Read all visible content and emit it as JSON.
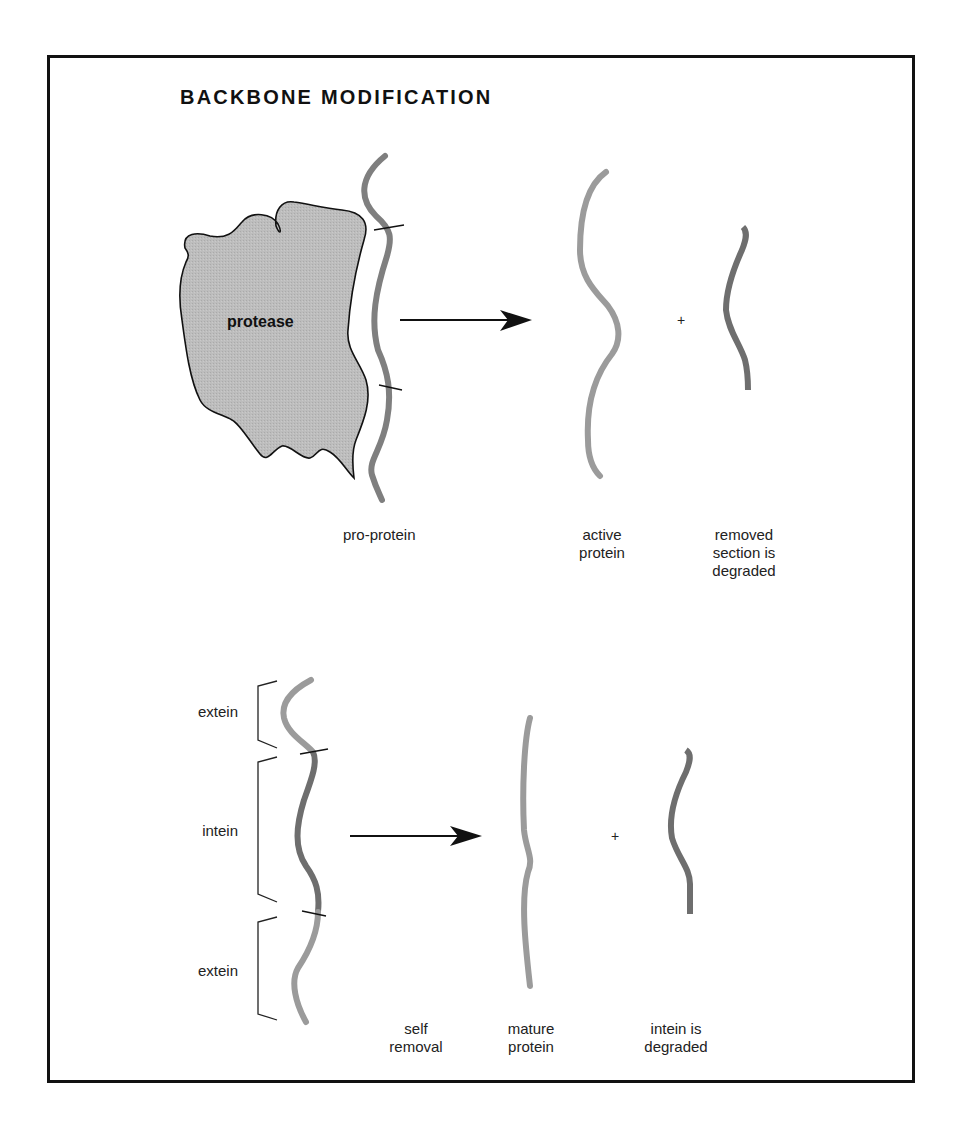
{
  "title": "BACKBONE MODIFICATION",
  "colors": {
    "frame": "#111111",
    "protease_fill": "#bdbdbd",
    "active_strand": "#9b9b9b",
    "removed_strand": "#6e6e6e",
    "arrow": "#111111"
  },
  "top_panel": {
    "enzyme_label": "protease",
    "plus": "+",
    "labels": {
      "pro_protein": "pro-protein",
      "active_protein_1": "active",
      "active_protein_2": "protein",
      "removed_1": "removed",
      "removed_2": "section is",
      "removed_3": "degraded"
    }
  },
  "bottom_panel": {
    "plus": "+",
    "brackets": {
      "top": "extein",
      "middle": "intein",
      "bottom": "extein"
    },
    "labels": {
      "self_1": "self",
      "self_2": "removal",
      "mature_1": "mature",
      "mature_2": "protein",
      "intein_1": "intein is",
      "intein_2": "degraded"
    }
  }
}
